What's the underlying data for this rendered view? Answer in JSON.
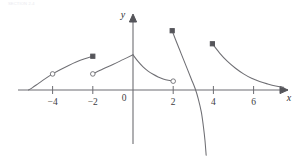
{
  "header": {
    "watermark_text": "SECTION 2.4"
  },
  "chart_data": {
    "type": "line",
    "title": "",
    "subtitle": "",
    "xlabel": "x",
    "ylabel": "y",
    "xlim": [
      -5.8,
      7.6
    ],
    "ylim": [
      -3.3,
      2.6
    ],
    "grid": false,
    "legend": null,
    "x_ticks": [
      -4,
      -2,
      2,
      4,
      6
    ],
    "x_tick_labels": [
      "-4",
      "-2",
      "2",
      "4",
      "6"
    ],
    "y_ticks": [],
    "y_tick_labels": [],
    "origin_label": "0",
    "axes": {
      "x_axis_arrow": true,
      "y_axis_arrow": true,
      "x_axis_y_value": 0,
      "y_axis_x_value": 0
    },
    "series": [
      {
        "name": "branch-1",
        "comment": "rising concave-down arc from x=-5.2 to x=-2",
        "points": [
          [
            -5.2,
            0.0
          ],
          [
            -5.0,
            0.12
          ],
          [
            -4.7,
            0.33
          ],
          [
            -4.4,
            0.54
          ],
          [
            -4.0,
            0.8
          ],
          [
            -3.6,
            1.02
          ],
          [
            -3.2,
            1.22
          ],
          [
            -2.8,
            1.4
          ],
          [
            -2.4,
            1.55
          ],
          [
            -2.0,
            1.68
          ]
        ],
        "endpoints": [
          {
            "x": -5.2,
            "y": 0.0,
            "marker": "none"
          },
          {
            "x": -2.0,
            "y": 1.68,
            "marker": "filled-square"
          }
        ],
        "interior_markers": [
          {
            "x": -4.0,
            "y": 0.8,
            "marker": "open-circle"
          }
        ]
      },
      {
        "name": "branch-2",
        "comment": "straight segment rising from open circle at x=-2 to peak at x=0",
        "points": [
          [
            -2.0,
            0.8
          ],
          [
            -1.5,
            1.04
          ],
          [
            -1.0,
            1.27
          ],
          [
            -0.5,
            1.51
          ],
          [
            0.0,
            1.75
          ]
        ],
        "endpoints": [
          {
            "x": -2.0,
            "y": 0.8,
            "marker": "open-circle"
          },
          {
            "x": 0.0,
            "y": 1.75,
            "marker": "none"
          }
        ],
        "interior_markers": []
      },
      {
        "name": "branch-3",
        "comment": "decaying convex curve from peak at x=0 down to open circle at x=2",
        "points": [
          [
            0.0,
            1.75
          ],
          [
            0.25,
            1.42
          ],
          [
            0.5,
            1.15
          ],
          [
            0.75,
            0.94
          ],
          [
            1.0,
            0.78
          ],
          [
            1.25,
            0.65
          ],
          [
            1.5,
            0.55
          ],
          [
            1.75,
            0.48
          ],
          [
            2.0,
            0.44
          ]
        ],
        "endpoints": [
          {
            "x": 0.0,
            "y": 1.75,
            "marker": "none"
          },
          {
            "x": 2.0,
            "y": 0.44,
            "marker": "open-circle"
          }
        ],
        "interior_markers": []
      },
      {
        "name": "branch-4",
        "comment": "steep falling curve from filled square at x=2 crossing x-axis near x=3.15 and descending off-frame",
        "points": [
          [
            1.95,
            2.95
          ],
          [
            2.1,
            2.55
          ],
          [
            2.3,
            2.05
          ],
          [
            2.5,
            1.55
          ],
          [
            2.7,
            1.05
          ],
          [
            2.9,
            0.55
          ],
          [
            3.1,
            0.05
          ],
          [
            3.25,
            -0.45
          ],
          [
            3.4,
            -1.1
          ],
          [
            3.5,
            -1.8
          ],
          [
            3.58,
            -2.5
          ],
          [
            3.64,
            -3.25
          ]
        ],
        "endpoints": [
          {
            "x": 1.95,
            "y": 2.95,
            "marker": "filled-square"
          },
          {
            "x": 3.64,
            "y": -3.25,
            "marker": "none"
          }
        ],
        "interior_markers": []
      },
      {
        "name": "branch-5",
        "comment": "decaying convex curve from filled square at x=4 approaching the x-axis asymptotically to the right",
        "points": [
          [
            3.95,
            2.3
          ],
          [
            4.3,
            1.85
          ],
          [
            4.7,
            1.42
          ],
          [
            5.1,
            1.08
          ],
          [
            5.5,
            0.8
          ],
          [
            5.9,
            0.58
          ],
          [
            6.3,
            0.42
          ],
          [
            6.7,
            0.3
          ],
          [
            7.1,
            0.2
          ],
          [
            7.5,
            0.13
          ]
        ],
        "endpoints": [
          {
            "x": 3.95,
            "y": 2.3,
            "marker": "filled-square"
          },
          {
            "x": 7.5,
            "y": 0.13,
            "marker": "none"
          }
        ],
        "interior_markers": []
      }
    ],
    "markers": {
      "filled_squares": [
        {
          "x": -2.0,
          "y": 1.68
        },
        {
          "x": 1.95,
          "y": 2.95
        },
        {
          "x": 3.95,
          "y": 2.3
        }
      ],
      "open_circles": [
        {
          "x": -4.0,
          "y": 0.8
        },
        {
          "x": -2.0,
          "y": 0.8
        },
        {
          "x": 2.0,
          "y": 0.44
        }
      ]
    }
  }
}
